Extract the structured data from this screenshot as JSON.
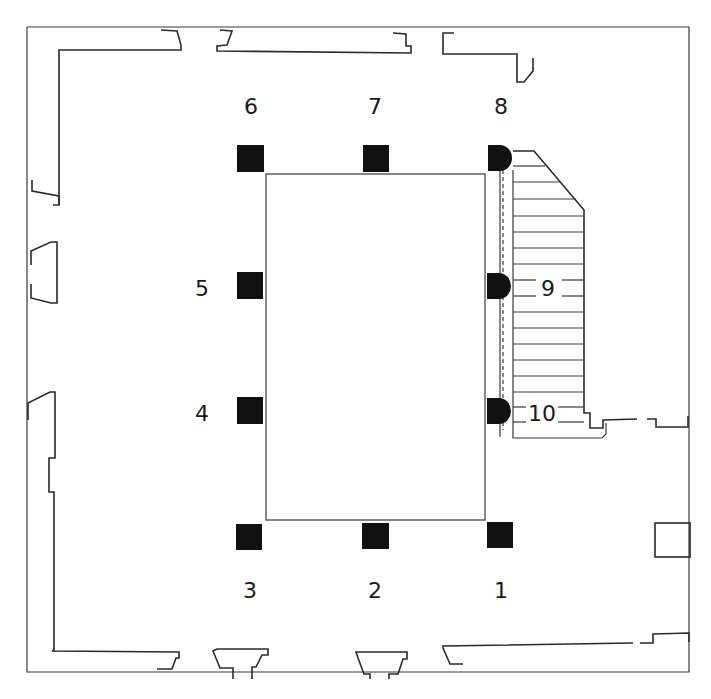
{
  "colors": {
    "line": "#2a2a2a",
    "column_fill": "#111111",
    "background": "#ffffff"
  },
  "columns": [
    {
      "id": "1",
      "label": "1",
      "shape": "square"
    },
    {
      "id": "2",
      "label": "2",
      "shape": "square"
    },
    {
      "id": "3",
      "label": "3",
      "shape": "square"
    },
    {
      "id": "4",
      "label": "4",
      "shape": "square"
    },
    {
      "id": "5",
      "label": "5",
      "shape": "square"
    },
    {
      "id": "6",
      "label": "6",
      "shape": "square"
    },
    {
      "id": "7",
      "label": "7",
      "shape": "square"
    },
    {
      "id": "8",
      "label": "8",
      "shape": "half-round"
    },
    {
      "id": "9",
      "label": "9",
      "shape": "half-round"
    },
    {
      "id": "10",
      "label": "10",
      "shape": "half-round"
    }
  ],
  "features": {
    "central_court": "rectangle",
    "staircase": "hatched stair block on right side",
    "steps_count": 15
  }
}
